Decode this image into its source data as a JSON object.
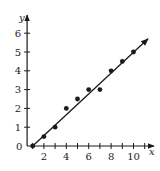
{
  "chart_data": {
    "type": "scatter",
    "title": "",
    "xlabel": "x",
    "ylabel": "y",
    "x": [
      1,
      2,
      3,
      4,
      5,
      6,
      7,
      8,
      9,
      10
    ],
    "y": [
      0,
      0.5,
      1,
      2,
      2.5,
      3,
      3,
      4,
      4.5,
      5
    ],
    "series": [
      {
        "name": "data points",
        "type": "scatter",
        "x": [
          1,
          2,
          3,
          4,
          5,
          6,
          7,
          8,
          9,
          10
        ],
        "values": [
          0,
          0.5,
          1,
          2,
          2.5,
          3,
          3,
          4,
          4.5,
          5
        ]
      },
      {
        "name": "fitted line",
        "type": "line",
        "x": [
          1,
          11.3
        ],
        "values": [
          0,
          5.7
        ]
      }
    ],
    "x_ticks": [
      2,
      4,
      6,
      8,
      10
    ],
    "x_minor_ticks": [
      1,
      2,
      3,
      4,
      5,
      6,
      7,
      8,
      9,
      10,
      11
    ],
    "y_ticks": [
      0,
      1,
      2,
      3,
      4,
      5,
      6
    ],
    "xlim": [
      0.5,
      11.5
    ],
    "ylim": [
      0,
      6.8
    ],
    "grid": false,
    "legend": "none",
    "colors": {
      "ink": "#1a1a1a",
      "background": "#ffffff"
    }
  },
  "labels": {
    "x_axis": "x",
    "y_axis": "y",
    "origin": "0",
    "x_tick_labels": [
      "2",
      "4",
      "6",
      "8",
      "10"
    ],
    "y_tick_labels": [
      "1",
      "2",
      "3",
      "4",
      "5",
      "6"
    ]
  }
}
